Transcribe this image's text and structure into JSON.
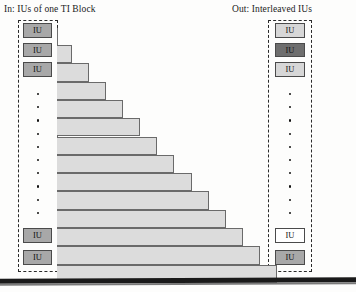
{
  "figure": {
    "kind": "diagram",
    "caption_left": "In: IUs of one TI Block",
    "caption_right": "Out: Interleaved IUs",
    "unit_label": "IU",
    "colors": {
      "bar_fill": "#dcdcdc",
      "bar_stroke": "#6a6a6a",
      "iu_gray": "#a8a8a8",
      "iu_light": "#d7d7d7",
      "iu_dark": "#6e6e6e",
      "iu_white": "#ffffff",
      "axis": "#6f6f6f",
      "dash": "#2a2a2a",
      "text": "#1b1b1b"
    }
  },
  "input_column": {
    "label": "In: IUs of one TI Block",
    "top_items": [
      {
        "text": "IU",
        "shade": "gray"
      },
      {
        "text": "IU",
        "shade": "gray"
      },
      {
        "text": "IU",
        "shade": "gray"
      }
    ],
    "ellipsis_dots": 10,
    "bottom_items": [
      {
        "text": "IU",
        "shade": "gray"
      },
      {
        "text": "IU",
        "shade": "gray"
      }
    ]
  },
  "output_column": {
    "label": "Out: Interleaved IUs",
    "top_items": [
      {
        "text": "IU",
        "shade": "light"
      },
      {
        "text": "IU",
        "shade": "dark"
      },
      {
        "text": "IU",
        "shade": "light"
      }
    ],
    "ellipsis_dots": 10,
    "bottom_items": [
      {
        "text": "IU",
        "shade": "white"
      },
      {
        "text": "IU",
        "shade": "gray"
      }
    ]
  },
  "chart_data": {
    "type": "bar",
    "orientation": "horizontal",
    "title": "",
    "xlabel": "",
    "ylabel": "",
    "grid": false,
    "legend": null,
    "categories": [
      "1",
      "2",
      "3",
      "4",
      "5",
      "6",
      "7",
      "8",
      "9",
      "10",
      "11",
      "12",
      "13"
    ],
    "values": [
      15,
      32,
      49,
      66,
      83,
      100,
      117,
      135,
      152,
      169,
      186,
      203,
      220
    ],
    "xlim": [
      0,
      225
    ],
    "note": "Staircase of 13 increasing-length horizontal bars representing growing interleaver delay lines."
  }
}
